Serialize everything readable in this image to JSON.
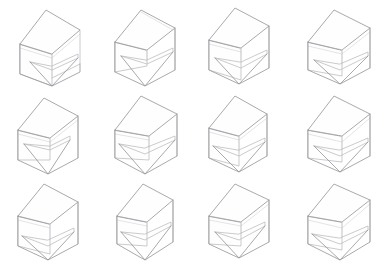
{
  "sheet": {
    "title": "Isometric wireframe variation grid",
    "background_color": "#ffffff",
    "line_color": "#b9b9bd",
    "line_color_strong": "#9a9a9f",
    "line_color_faint": "#d6d6da",
    "columns": 4,
    "rows": 3,
    "cell_count": 12,
    "cell_width": 96.5,
    "cell_height": 88,
    "drawing_style": "thin light-gray isometric line drawing, no labels, no axes"
  },
  "cells": [
    {
      "index": 1,
      "row": 1,
      "column": 1,
      "name": "variation-1",
      "description": "Open-front cubic frame with flat top panel and a cantilevered seat slab angled down to the front corner",
      "paths": {
        "outer_shell": "M 20 44 L 20 74 L 52 86 L 80 72 L 80 64",
        "top_face": "M 20 44 L 46 10 L 80 30 L 52 54 Z",
        "left_face": "M 20 44 L 52 54 L 52 86 L 20 74 Z",
        "right_edge": "M 80 30 L 80 64 L 52 78",
        "inner_back_post": "M 52 54 L 52 78",
        "seat_slab": "M 30 62 L 52 70 L 78 58 L 78 54 L 52 66 Z",
        "seat_fold": "M 30 62 L 52 86 L 78 58",
        "cross_brace": "M 20 48 L 52 58 L 80 34"
      }
    },
    {
      "index": 2,
      "row": 1,
      "column": 2,
      "name": "variation-2",
      "description": "Cubic frame with narrow top shelf and a deep V-shaped seat plane folding to a low point",
      "paths": {
        "outer_shell": "M 18 42 L 18 72 L 48 86 L 78 70 L 78 28",
        "top_face": "M 18 42 L 44 10 L 78 28 L 50 50 Z",
        "left_face": "M 18 42 L 50 50 L 50 66 L 18 72 Z",
        "right_edge": "M 78 28 L 78 70",
        "inner_back_post": "M 50 50 L 50 62",
        "seat_slab": "M 24 56 L 50 64 L 76 52 L 76 48 L 50 60 Z",
        "seat_fold": "M 24 56 L 48 86 L 76 52",
        "cross_brace": "M 44 12 L 76 30"
      }
    },
    {
      "index": 3,
      "row": 1,
      "column": 3,
      "name": "variation-3",
      "description": "Tall open cube with thick back slab and horizontal seat plate cantilevered to the right",
      "paths": {
        "outer_shell": "M 16 40 L 16 70 L 46 84 L 76 68 L 76 26",
        "top_face": "M 16 40 L 42 8 L 76 26 L 48 48 Z",
        "left_face": "M 16 40 L 48 48 L 48 80 L 16 70 Z",
        "right_edge": "M 76 26 L 76 68",
        "inner_back_post": "M 48 48 L 48 62",
        "seat_slab": "M 22 58 L 48 68 L 74 54 L 74 50 L 48 62 Z",
        "seat_fold": "M 22 58 L 46 84 L 74 54",
        "cross_brace": "M 16 44 L 48 52"
      }
    },
    {
      "index": 4,
      "row": 1,
      "column": 4,
      "name": "variation-4",
      "description": "Cube with wide top plane and broad flat seat tray with raised front lip",
      "paths": {
        "outer_shell": "M 18 42 L 18 70 L 50 84 L 80 68 L 80 28",
        "top_face": "M 18 42 L 44 10 L 80 28 L 52 50 Z",
        "left_face": "M 18 42 L 52 50 L 52 76 L 18 70 Z",
        "right_edge": "M 80 28 L 80 68",
        "inner_back_post": "M 52 50 L 52 66",
        "seat_slab": "M 24 60 L 50 70 L 78 56 L 78 52 L 50 64 Z",
        "seat_fold": "M 24 60 L 50 84 L 78 56",
        "cross_brace": "M 18 46 L 52 54 L 80 32"
      }
    },
    {
      "index": 5,
      "row": 2,
      "column": 1,
      "name": "variation-5",
      "description": "Open cube with a sharply pointed triangular seat wedge dropping to a single low apex",
      "paths": {
        "outer_shell": "M 18 42 L 18 72 L 48 86 L 78 70 L 78 28",
        "top_face": "M 18 42 L 44 10 L 78 28 L 50 50 Z",
        "left_face": "M 18 42 L 50 50 L 50 72 L 18 72 Z",
        "right_edge": "M 78 28 L 78 70",
        "inner_back_post": "M 50 50 L 50 58",
        "seat_slab": "M 24 56 L 50 62 L 70 52 L 70 48 L 50 58 Z",
        "seat_fold": "M 24 56 L 48 86 L 70 52",
        "cross_brace": "M 18 46 L 50 54 L 78 32"
      }
    },
    {
      "index": 6,
      "row": 2,
      "column": 2,
      "name": "variation-6",
      "description": "Cube frame with top panel and a faceted seat basin folding inward toward the bottom corner",
      "paths": {
        "outer_shell": "M 18 42 L 18 70 L 48 86 L 80 68 L 80 26",
        "top_face": "M 18 42 L 44 8 L 80 26 L 52 48 Z",
        "left_face": "M 18 42 L 52 48 L 52 72 L 18 70 Z",
        "right_edge": "M 80 26 L 80 68",
        "inner_back_post": "M 52 48 L 52 60",
        "seat_slab": "M 22 56 L 48 66 L 78 52 L 78 48 L 48 60 Z",
        "seat_fold": "M 22 56 L 48 86 L 78 52",
        "cross_brace": "M 18 46 L 52 52"
      }
    },
    {
      "index": 7,
      "row": 2,
      "column": 3,
      "name": "variation-7",
      "description": "C-shaped open cube with a recessed rectangular seat shelf and visible back corner post",
      "paths": {
        "outer_shell": "M 16 40 L 16 70 L 46 84 L 74 68 L 74 26",
        "top_face": "M 16 40 L 42 8 L 74 26 L 46 48 Z",
        "left_face": "M 16 40 L 46 48 L 46 78 L 16 70 Z",
        "right_edge": "M 74 26 L 74 68",
        "inner_back_post": "M 46 48 L 46 64",
        "seat_slab": "M 20 58 L 46 68 L 72 54 L 72 50 L 46 62 Z",
        "seat_fold": "M 20 58 L 46 84 L 72 54",
        "cross_brace": "M 16 44 L 46 52 L 74 30"
      }
    },
    {
      "index": 8,
      "row": 2,
      "column": 4,
      "name": "variation-8",
      "description": "Cube with large top plane and a thick wedge seat whose front face tilts steeply down-right",
      "paths": {
        "outer_shell": "M 18 42 L 18 70 L 50 84 L 80 68 L 80 26",
        "top_face": "M 18 42 L 44 8 L 80 26 L 52 48 Z",
        "left_face": "M 18 42 L 52 48 L 52 74 L 18 70 Z",
        "right_edge": "M 80 26 L 80 68",
        "inner_back_post": "M 52 48 L 52 60",
        "seat_slab": "M 24 58 L 50 68 L 78 54 L 78 50 L 50 62 Z",
        "seat_fold": "M 24 58 L 50 84 L 78 54",
        "cross_brace": "M 18 46 L 52 54 L 80 30"
      }
    },
    {
      "index": 9,
      "row": 3,
      "column": 1,
      "name": "variation-9",
      "description": "Box with full flat top lid and a thin low shelf spanning the interior near the base",
      "paths": {
        "outer_shell": "M 18 40 L 18 70 L 48 84 L 78 68 L 78 26",
        "top_face": "M 18 40 L 44 8 L 78 26 L 50 48 Z",
        "left_face": "M 18 40 L 50 48 L 50 78 L 18 70 Z",
        "right_edge": "M 78 26 L 78 68",
        "inner_back_post": "M 50 48 L 50 64",
        "seat_slab": "M 22 60 L 48 70 L 74 56 L 74 52 L 48 64 Z",
        "seat_fold": "M 22 60 L 48 84 L 74 56",
        "cross_brace": "M 18 44 L 50 52"
      }
    },
    {
      "index": 10,
      "row": 3,
      "column": 2,
      "name": "variation-10",
      "description": "Narrow upright cube with curved right flank and a V-folded seat plane reaching the bottom apex",
      "paths": {
        "outer_shell": "M 20 40 L 20 68 L 48 84 L 76 66 L 76 24",
        "top_face": "M 20 40 L 46 8 L 76 24 L 50 46 Z",
        "left_face": "M 20 40 L 50 46 L 50 70 L 20 68 Z",
        "right_edge": "M 76 24 L 76 66",
        "inner_back_post": "M 50 46 L 50 58",
        "seat_slab": "M 24 56 L 48 64 L 74 50 L 74 46 L 48 58 Z",
        "seat_fold": "M 24 56 L 48 84 L 74 50",
        "cross_brace": "M 20 44 L 50 50"
      }
    },
    {
      "index": 11,
      "row": 3,
      "column": 3,
      "name": "variation-11",
      "description": "Open cube with cantilevered top wing and a triangular seat fin pointing down to a sharp corner",
      "paths": {
        "outer_shell": "M 16 40 L 16 68 L 46 82 L 76 66 L 76 24",
        "top_face": "M 16 40 L 42 8 L 76 24 L 48 46 Z",
        "left_face": "M 16 40 L 48 46 L 48 70 L 16 68 Z",
        "right_edge": "M 76 24 L 76 66",
        "inner_back_post": "M 48 46 L 48 58",
        "seat_slab": "M 22 56 L 46 64 L 72 50 L 72 46 L 46 58 Z",
        "seat_fold": "M 22 56 L 46 82 L 72 50",
        "cross_brace": "M 16 44 L 48 50 L 76 28"
      }
    },
    {
      "index": 12,
      "row": 3,
      "column": 4,
      "name": "variation-12",
      "description": "Cube with deep top overhang and a broad flat seat tray with a bent front edge running to the right",
      "paths": {
        "outer_shell": "M 18 40 L 18 68 L 50 84 L 80 66 L 80 24",
        "top_face": "M 18 40 L 44 8 L 80 24 L 52 46 Z",
        "left_face": "M 18 40 L 52 46 L 52 74 L 18 68 Z",
        "right_edge": "M 80 24 L 80 66",
        "inner_back_post": "M 52 46 L 52 60",
        "seat_slab": "M 22 58 L 50 68 L 78 54 L 78 50 L 50 62 Z",
        "seat_fold": "M 22 58 L 50 84 L 78 54",
        "cross_brace": "M 18 44 L 52 52 L 80 28"
      }
    }
  ]
}
